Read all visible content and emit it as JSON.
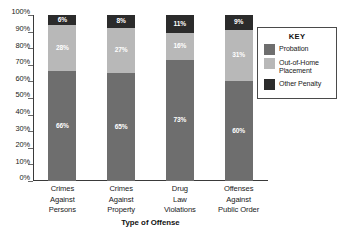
{
  "chart_data": {
    "type": "bar",
    "subtype": "stacked-100-percent",
    "title": "",
    "xlabel": "Type of Offense",
    "ylabel": "",
    "categories": [
      "Crimes Against Persons",
      "Crimes Against Property",
      "Drug Law Violations",
      "Offenses Against Public Order"
    ],
    "category_lines": [
      [
        "Crimes",
        "Against",
        "Persons"
      ],
      [
        "Crimes",
        "Against",
        "Property"
      ],
      [
        "Drug",
        "Law",
        "Violations"
      ],
      [
        "Offenses",
        "Against",
        "Public Order"
      ]
    ],
    "series": [
      {
        "name": "Probation",
        "values": [
          66,
          65,
          73,
          60
        ],
        "color": "#6e6e6e"
      },
      {
        "name": "Out-of-Home Placement",
        "values": [
          28,
          27,
          16,
          31
        ],
        "color": "#b8b8b8"
      },
      {
        "name": "Other Penalty",
        "values": [
          6,
          8,
          11,
          9
        ],
        "color": "#2b2b2b"
      }
    ],
    "value_labels": [
      [
        "66%",
        "65%",
        "73%",
        "60%"
      ],
      [
        "28%",
        "27%",
        "16%",
        "31%"
      ],
      [
        "6%",
        "8%",
        "11%",
        "9%"
      ]
    ],
    "ylim": [
      0,
      100
    ],
    "ytick_values": [
      0,
      10,
      20,
      30,
      40,
      50,
      60,
      70,
      80,
      90,
      100
    ],
    "ytick_labels": [
      "0%",
      "10%",
      "20%",
      "30%",
      "40%",
      "50%",
      "60%",
      "70%",
      "80%",
      "90%",
      "100%"
    ],
    "grid": false,
    "legend_position": "right"
  },
  "legend": {
    "title": "KEY",
    "items": [
      {
        "label_lines": [
          "Probation"
        ],
        "color": "#6e6e6e"
      },
      {
        "label_lines": [
          "Out-of-Home",
          "Placement"
        ],
        "color": "#b8b8b8"
      },
      {
        "label_lines": [
          "Other Penalty"
        ],
        "color": "#2b2b2b"
      }
    ]
  },
  "source_note": ""
}
